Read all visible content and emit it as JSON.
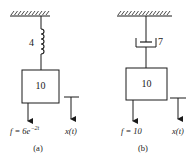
{
  "diagrams": [
    {
      "id": "a",
      "caption": "(a)",
      "support": "fixed-ceiling",
      "element": {
        "type": "spring",
        "value_label": "4"
      },
      "mass": {
        "label": "10"
      },
      "force": {
        "prefix": "f = 6e",
        "exponent": "−2t"
      },
      "displacement": {
        "label": "x(t)"
      }
    },
    {
      "id": "b",
      "caption": "(b)",
      "support": "fixed-ceiling",
      "element": {
        "type": "dashpot",
        "value_label": "7"
      },
      "mass": {
        "label": "10"
      },
      "force": {
        "prefix": "f = 10"
      },
      "displacement": {
        "label": "x(t)"
      }
    }
  ],
  "colors": {
    "line": "#1a1a1a",
    "background": "#ffffff"
  }
}
